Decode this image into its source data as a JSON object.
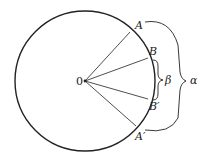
{
  "diagram": {
    "colors": {
      "stroke": "#222222",
      "background": "#ffffff"
    },
    "center": {
      "label": "0",
      "x": 85,
      "y": 81
    },
    "radius": 70,
    "points": [
      {
        "id": "A",
        "label": "A",
        "x": 130,
        "y": 32
      },
      {
        "id": "B",
        "label": "B",
        "x": 148,
        "y": 58
      },
      {
        "id": "B_prime",
        "label": "B′",
        "x": 148,
        "y": 99
      },
      {
        "id": "A_prime",
        "label": "A′",
        "x": 136,
        "y": 126
      }
    ],
    "braces": [
      {
        "id": "beta",
        "label": "β",
        "from": "B",
        "to": "B_prime"
      },
      {
        "id": "alpha",
        "label": "α",
        "from": "A",
        "to": "A_prime"
      }
    ]
  }
}
